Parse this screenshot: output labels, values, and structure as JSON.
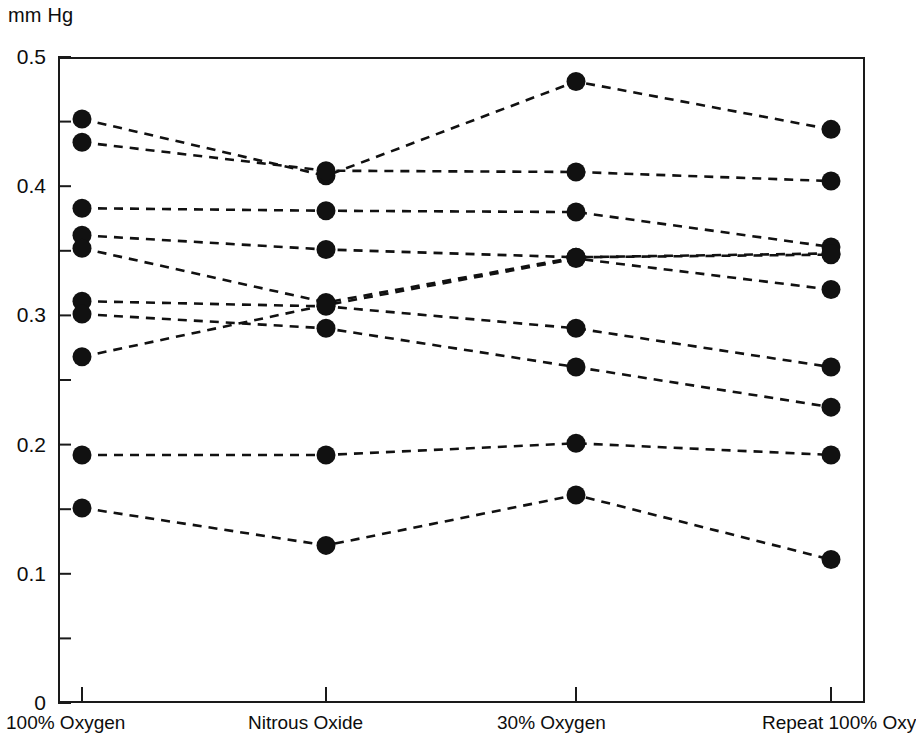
{
  "chart_data": {
    "type": "line",
    "title": "",
    "subtitle": "",
    "ylabel": "mm Hg",
    "xlabel": "",
    "ylim": [
      0,
      0.5
    ],
    "y_ticks_major": [
      0,
      0.1,
      0.2,
      0.3,
      0.4,
      0.5
    ],
    "y_tick_labels": [
      "0",
      "0.1",
      "0.2",
      "0.3",
      "0.4",
      "0.5"
    ],
    "y_ticks_minor": [
      0.05,
      0.15,
      0.25,
      0.35,
      0.45
    ],
    "grid": false,
    "legend": "none",
    "marker": "filled-circle",
    "line_style": "dashed",
    "line_color": "#111111",
    "marker_color": "#111111",
    "categories": [
      "100% Oxygen",
      "Nitrous Oxide",
      "30% Oxygen",
      "Repeat 100% Oxygen"
    ],
    "x_tick_labels": [
      "100% Oxygen",
      "Nitrous Oxide",
      "30% Oxygen",
      "Repeat 100% Oxy"
    ],
    "x_tick_label_note": "fourth label is clipped at the right image edge",
    "series": [
      {
        "name": "Subject 1",
        "values": [
          0.452,
          0.408,
          0.481,
          0.444
        ]
      },
      {
        "name": "Subject 2",
        "values": [
          0.434,
          0.412,
          0.411,
          0.404
        ]
      },
      {
        "name": "Subject 3",
        "values": [
          0.383,
          0.381,
          0.38,
          0.353
        ]
      },
      {
        "name": "Subject 4",
        "values": [
          0.362,
          0.351,
          0.345,
          0.347
        ]
      },
      {
        "name": "Subject 5",
        "values": [
          0.352,
          0.31,
          0.345,
          0.348
        ]
      },
      {
        "name": "Subject 6",
        "values": [
          0.311,
          0.307,
          0.29,
          0.26
        ]
      },
      {
        "name": "Subject 7",
        "values": [
          0.301,
          0.29,
          0.26,
          0.229
        ]
      },
      {
        "name": "Subject 8",
        "values": [
          0.268,
          0.308,
          0.344,
          0.32
        ]
      },
      {
        "name": "Subject 9",
        "values": [
          0.192,
          0.192,
          0.201,
          0.192
        ]
      },
      {
        "name": "Subject 10",
        "values": [
          0.151,
          0.122,
          0.161,
          0.111
        ]
      }
    ]
  }
}
